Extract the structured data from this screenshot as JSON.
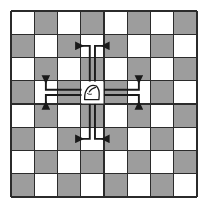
{
  "figure": {
    "title": "Knight move diagram",
    "piece": "knight",
    "piece_glyph": "white-knight",
    "board": {
      "columns": 8,
      "rows": 8,
      "light_color": "#ffffff",
      "dark_color": "#9d9d9d",
      "line_color": "#2b2b2b",
      "top_left_square": "light",
      "square_size_px": 23.25,
      "origin_x_px": 11,
      "origin_y_px": 11
    },
    "knight_position": {
      "col": 3,
      "row": 3
    },
    "moves": [
      {
        "id": "up-left",
        "label": "up 2, left 1",
        "dx": -1,
        "dy": -2,
        "arrow": "left"
      },
      {
        "id": "up-right",
        "label": "up 2, right 1",
        "dx": 1,
        "dy": -2,
        "arrow": "right"
      },
      {
        "id": "left-up",
        "label": "left 2, up 1",
        "dx": -2,
        "dy": -1,
        "arrow": "up"
      },
      {
        "id": "left-down",
        "label": "left 2, down 1",
        "dx": -2,
        "dy": 1,
        "arrow": "down"
      },
      {
        "id": "right-up",
        "label": "right 2, up 1",
        "dx": 2,
        "dy": -1,
        "arrow": "up"
      },
      {
        "id": "right-down",
        "label": "right 2, down 1",
        "dx": 2,
        "dy": 1,
        "arrow": "down"
      },
      {
        "id": "down-left",
        "label": "down 2, left 1",
        "dx": -1,
        "dy": 2,
        "arrow": "left"
      },
      {
        "id": "down-right",
        "label": "down 2, right 1",
        "dx": 1,
        "dy": 2,
        "arrow": "right"
      }
    ],
    "move_count": 8,
    "arrow_color": "#1a1a1a"
  }
}
